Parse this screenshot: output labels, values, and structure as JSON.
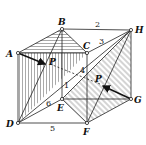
{
  "figure": {
    "vertices": [
      {
        "id": "A",
        "label": "A",
        "x": 18,
        "y": 53
      },
      {
        "id": "B",
        "label": "B",
        "x": 62,
        "y": 29
      },
      {
        "id": "C",
        "label": "C",
        "x": 87,
        "y": 53
      },
      {
        "id": "H",
        "label": "H",
        "x": 131,
        "y": 30
      },
      {
        "id": "D",
        "label": "D",
        "x": 18,
        "y": 123
      },
      {
        "id": "E",
        "label": "E",
        "x": 62,
        "y": 99
      },
      {
        "id": "F",
        "label": "F",
        "x": 87,
        "y": 123
      },
      {
        "id": "G",
        "label": "G",
        "x": 131,
        "y": 99
      }
    ],
    "edge_numbers": [
      {
        "label": "1",
        "x": 64,
        "y": 88
      },
      {
        "label": "2",
        "x": 97,
        "y": 27
      },
      {
        "label": "3",
        "x": 101,
        "y": 43
      },
      {
        "label": "4",
        "x": 81,
        "y": 72
      },
      {
        "label": "5",
        "x": 52,
        "y": 131
      },
      {
        "label": "6",
        "x": 48,
        "y": 104
      }
    ],
    "points": [
      {
        "label": "P",
        "x": 50,
        "y": 64
      },
      {
        "label": "P",
        "x": 97,
        "y": 82
      }
    ],
    "colors": {
      "stroke": "#222222",
      "hatch": "#444444",
      "background": "#ffffff"
    }
  }
}
